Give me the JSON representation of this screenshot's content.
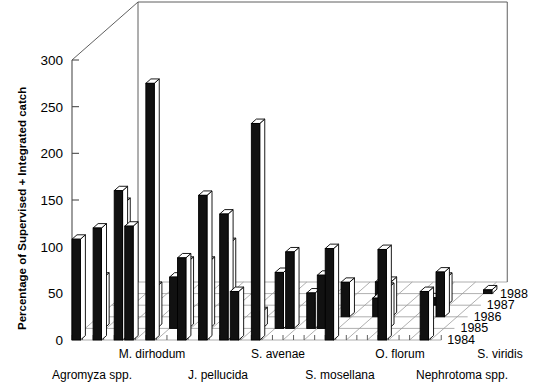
{
  "figure": {
    "clipped_header_text": "Figure continues above the crop line",
    "ylabel": "Percentage of Supervised + Integrated catch"
  },
  "chart_data": {
    "type": "bar",
    "title": "",
    "subtitle": "",
    "xlabel": "",
    "ylabel": "Percentage of Supervised + Integrated catch",
    "ylim": [
      0,
      300
    ],
    "yticks": [
      0,
      50,
      100,
      150,
      200,
      250,
      300
    ],
    "ytick_labels": [
      "0",
      "50",
      "100",
      "150",
      "200",
      "250",
      "300"
    ],
    "grid": true,
    "legend_position": "right-depth-axis",
    "projection": "3d",
    "depth_axis_name": "Year",
    "depth_categories": [
      "1984",
      "1985",
      "1986",
      "1987",
      "1988"
    ],
    "categories": [
      "Agromyza spp.",
      "M. dirhodum",
      "J. pellucida",
      "S. avenae",
      "S. mosellana",
      "O. florum",
      "Nephrotoma spp.",
      "S. viridis"
    ],
    "category_label_rows": {
      "upper_row": [
        "M. dirhodum",
        "S. avenae",
        "O. florum",
        "S. viridis"
      ],
      "lower_row": [
        "Agromyza spp.",
        "J. pellucida",
        "S. mosellana",
        "Nephrotoma spp."
      ]
    },
    "series": [
      {
        "name": "1988",
        "values": [
          108,
          160,
          72,
          135,
          82,
          98,
          97,
          52
        ]
      },
      {
        "name": "1987",
        "values": [
          55,
          135,
          88,
          92,
          60,
          57,
          38,
          30
        ]
      },
      {
        "name": "1986",
        "values": [
          120,
          122,
          155,
          52,
          38,
          37,
          20,
          12
        ]
      },
      {
        "name": "1985",
        "values": [
          135,
          45,
          72,
          18,
          15,
          25,
          8,
          4
        ]
      },
      {
        "name": "1984",
        "values": [
          160,
          275,
          232,
          0,
          0,
          0,
          0,
          0
        ]
      }
    ]
  },
  "bars": [
    {
      "x": 0,
      "row": 0,
      "value": 108
    },
    {
      "x": 1,
      "row": 1,
      "value": 55
    },
    {
      "x": 2,
      "row": 0,
      "value": 120
    },
    {
      "x": 3,
      "row": 1,
      "value": 135
    },
    {
      "x": 4,
      "row": 0,
      "value": 160
    },
    {
      "x": 5,
      "row": 0,
      "value": 122
    },
    {
      "x": 6,
      "row": 1,
      "value": 45
    },
    {
      "x": 7,
      "row": 0,
      "value": 275
    },
    {
      "x": 8,
      "row": 1,
      "value": 55
    },
    {
      "x": 9,
      "row": 1,
      "value": 72
    },
    {
      "x": 10,
      "row": 0,
      "value": 88
    },
    {
      "x": 11,
      "row": 1,
      "value": 72
    },
    {
      "x": 12,
      "row": 0,
      "value": 155
    },
    {
      "x": 13,
      "row": 1,
      "value": 92
    },
    {
      "x": 14,
      "row": 0,
      "value": 135
    },
    {
      "x": 15,
      "row": 0,
      "value": 52
    },
    {
      "x": 16,
      "row": 1,
      "value": 18
    },
    {
      "x": 17,
      "row": 0,
      "value": 232
    },
    {
      "x": 18,
      "row": 1,
      "value": 60
    },
    {
      "x": 19,
      "row": 1,
      "value": 82
    },
    {
      "x": 20,
      "row": 2,
      "value": 15
    },
    {
      "x": 21,
      "row": 1,
      "value": 38
    },
    {
      "x": 22,
      "row": 1,
      "value": 57
    },
    {
      "x": 23,
      "row": 2,
      "value": 37
    },
    {
      "x": 24,
      "row": 0,
      "value": 98
    },
    {
      "x": 25,
      "row": 3,
      "value": 25
    },
    {
      "x": 26,
      "row": 2,
      "value": 20
    },
    {
      "x": 27,
      "row": 2,
      "value": 38
    },
    {
      "x": 28,
      "row": 1,
      "value": 44
    },
    {
      "x": 29,
      "row": 0,
      "value": 97
    },
    {
      "x": 30,
      "row": 3,
      "value": 8
    },
    {
      "x": 31,
      "row": 3,
      "value": 30
    },
    {
      "x": 32,
      "row": 2,
      "value": 48
    },
    {
      "x": 33,
      "row": 0,
      "value": 52
    },
    {
      "x": 34,
      "row": 4,
      "value": 4
    }
  ],
  "colors": {
    "bar_front": "#111111",
    "bar_top": "#ffffff",
    "bar_side": "#ffffff",
    "outline": "#000000",
    "grid": "#9a9a9a",
    "axis": "#4d4d4d",
    "background": "#ffffff",
    "text": "#000000"
  }
}
